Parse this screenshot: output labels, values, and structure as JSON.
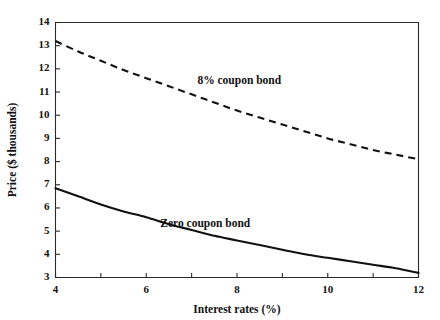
{
  "chart_data": {
    "type": "line",
    "title": "",
    "xlabel": "Interest rates (%)",
    "ylabel": "Price ($ thousands)",
    "xlim": [
      4,
      12
    ],
    "ylim": [
      3,
      14
    ],
    "grid": false,
    "legend_position": "inline-annotation",
    "x_ticks": [
      4,
      5,
      6,
      7,
      8,
      9,
      10,
      11,
      12
    ],
    "x_tick_labels": [
      "4",
      "",
      "6",
      "",
      "8",
      "",
      "10",
      "",
      "12"
    ],
    "y_ticks": [
      3,
      4,
      5,
      6,
      7,
      8,
      9,
      10,
      11,
      12,
      13,
      14
    ],
    "y_tick_labels": [
      "3",
      "4",
      "5",
      "6",
      "7",
      "8",
      "9",
      "10",
      "11",
      "12",
      "13",
      "14"
    ],
    "x": [
      4,
      4.5,
      5,
      5.5,
      6,
      6.5,
      7,
      7.5,
      8,
      8.5,
      9,
      9.5,
      10,
      10.5,
      11,
      11.5,
      12
    ],
    "series": [
      {
        "name": "8% coupon bond",
        "style": "dashed",
        "color": "#111111",
        "values": [
          13.2,
          12.75,
          12.35,
          11.95,
          11.6,
          11.25,
          10.9,
          10.55,
          10.2,
          9.9,
          9.6,
          9.3,
          9.0,
          8.75,
          8.5,
          8.3,
          8.1
        ],
        "label_x": 8.05,
        "label_y": 11.35
      },
      {
        "name": "Zero coupon bond",
        "style": "solid",
        "color": "#111111",
        "values": [
          6.85,
          6.5,
          6.15,
          5.85,
          5.6,
          5.3,
          5.05,
          4.8,
          4.6,
          4.4,
          4.2,
          4.0,
          3.85,
          3.7,
          3.55,
          3.4,
          3.2
        ],
        "label_x": 7.3,
        "label_y": 5.2
      }
    ],
    "annotations": [
      {
        "text": "8% coupon bond",
        "x": 8.05,
        "y": 11.35
      },
      {
        "text": "Zero coupon bond",
        "x": 7.3,
        "y": 5.2
      }
    ]
  }
}
